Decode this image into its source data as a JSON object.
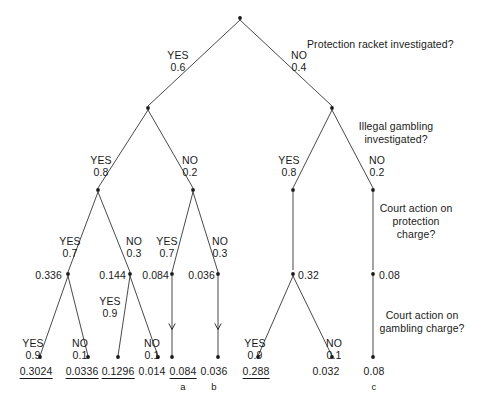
{
  "diagram": {
    "type": "probability-decision-tree",
    "title_questions": [
      {
        "id": "q1",
        "text": "Protection racket investigated?",
        "x": 307,
        "y": 38,
        "align": "left"
      },
      {
        "id": "q2",
        "text": "Illegal gambling\ninvestigated?",
        "x": 396,
        "y": 120,
        "align": "center"
      },
      {
        "id": "q3",
        "text": "Court action on\nprotection\ncharge?",
        "x": 416,
        "y": 202,
        "align": "center"
      },
      {
        "id": "q4",
        "text": "Court action on\ngambling charge?",
        "x": 422,
        "y": 309,
        "align": "center"
      }
    ],
    "branch_labels": [
      {
        "id": "b-root-yes",
        "answer": "YES",
        "prob": "0.6",
        "x": 178,
        "y": 49
      },
      {
        "id": "b-root-no",
        "answer": "NO",
        "prob": "0.4",
        "x": 299,
        "y": 49
      },
      {
        "id": "b-l-yes",
        "answer": "YES",
        "prob": "0.8",
        "x": 101,
        "y": 154
      },
      {
        "id": "b-l-no",
        "answer": "NO",
        "prob": "0.2",
        "x": 190,
        "y": 154
      },
      {
        "id": "b-r-yes",
        "answer": "YES",
        "prob": "0.8",
        "x": 289,
        "y": 154
      },
      {
        "id": "b-r-no",
        "answer": "NO",
        "prob": "0.2",
        "x": 377,
        "y": 154
      },
      {
        "id": "b-ll-yes",
        "answer": "YES",
        "prob": "0.7",
        "x": 70,
        "y": 235
      },
      {
        "id": "b-ll-no",
        "answer": "NO",
        "prob": "0.3",
        "x": 134,
        "y": 235
      },
      {
        "id": "b-lr-yes",
        "answer": "YES",
        "prob": "0.7",
        "x": 167,
        "y": 235
      },
      {
        "id": "b-lr-no",
        "answer": "NO",
        "prob": "0.3",
        "x": 220,
        "y": 235
      },
      {
        "id": "b-lll-yes",
        "answer": "YES",
        "prob": "0.9",
        "x": 33,
        "y": 337
      },
      {
        "id": "b-lll-no",
        "answer": "NO",
        "prob": "0.1",
        "x": 80,
        "y": 337
      },
      {
        "id": "b-llr-yes",
        "answer": "YES",
        "prob": "0.9",
        "x": 110,
        "y": 295
      },
      {
        "id": "b-llr-no",
        "answer": "NO",
        "prob": "0.1",
        "x": 152,
        "y": 337
      },
      {
        "id": "b-rl-yes",
        "answer": "YES",
        "prob": "0.9",
        "x": 255,
        "y": 337
      },
      {
        "id": "b-rl-no",
        "answer": "NO",
        "prob": "0.1",
        "x": 334,
        "y": 337
      }
    ],
    "node_values": [
      {
        "id": "v-0336",
        "text": "0.336",
        "x": 62,
        "y": 269,
        "align": "right"
      },
      {
        "id": "v-0144",
        "text": "0.144",
        "x": 126,
        "y": 269,
        "align": "right"
      },
      {
        "id": "v-0084m",
        "text": "0.084",
        "x": 169,
        "y": 269,
        "align": "right"
      },
      {
        "id": "v-0036m",
        "text": "0.036",
        "x": 215,
        "y": 269,
        "align": "right"
      },
      {
        "id": "v-032",
        "text": "0.32",
        "x": 298,
        "y": 269,
        "align": "left"
      },
      {
        "id": "v-008m",
        "text": "0.08",
        "x": 379,
        "y": 269,
        "align": "left"
      }
    ],
    "terminals": [
      {
        "id": "t-03024",
        "text": "0.3024",
        "x": 36,
        "y": 365,
        "underline": true,
        "tag": ""
      },
      {
        "id": "t-00336",
        "text": "0.0336",
        "x": 82,
        "y": 365,
        "underline": true,
        "tag": ""
      },
      {
        "id": "t-01296",
        "text": "0.1296",
        "x": 118,
        "y": 365,
        "underline": true,
        "tag": ""
      },
      {
        "id": "t-0014",
        "text": "0.014",
        "x": 152,
        "y": 365,
        "underline": false,
        "tag": ""
      },
      {
        "id": "t-0084",
        "text": "0.084",
        "x": 183,
        "y": 365,
        "underline": true,
        "tag": "a"
      },
      {
        "id": "t-0036",
        "text": "0.036",
        "x": 214,
        "y": 365,
        "underline": false,
        "tag": "b"
      },
      {
        "id": "t-0288",
        "text": "0.288",
        "x": 256,
        "y": 365,
        "underline": true,
        "tag": ""
      },
      {
        "id": "t-0032",
        "text": "0.032",
        "x": 326,
        "y": 365,
        "underline": false,
        "tag": ""
      },
      {
        "id": "t-008",
        "text": "0.08",
        "x": 374,
        "y": 365,
        "underline": false,
        "tag": "c"
      }
    ],
    "edges": [
      {
        "id": "e-root-l",
        "x1": 240,
        "y1": 20,
        "x2": 148,
        "y2": 106,
        "arrow": false
      },
      {
        "id": "e-root-r",
        "x1": 240,
        "y1": 20,
        "x2": 332,
        "y2": 106,
        "arrow": false
      },
      {
        "id": "e-l-ll",
        "x1": 148,
        "y1": 110,
        "x2": 98,
        "y2": 188,
        "arrow": false
      },
      {
        "id": "e-l-lr",
        "x1": 148,
        "y1": 110,
        "x2": 193,
        "y2": 188,
        "arrow": false
      },
      {
        "id": "e-r-rl",
        "x1": 332,
        "y1": 110,
        "x2": 293,
        "y2": 188,
        "arrow": false
      },
      {
        "id": "e-r-rr",
        "x1": 332,
        "y1": 110,
        "x2": 373,
        "y2": 188,
        "arrow": false
      },
      {
        "id": "e-ll-a",
        "x1": 98,
        "y1": 192,
        "x2": 68,
        "y2": 272,
        "arrow": false
      },
      {
        "id": "e-ll-b",
        "x1": 98,
        "y1": 192,
        "x2": 130,
        "y2": 272,
        "arrow": false
      },
      {
        "id": "e-lr-a",
        "x1": 193,
        "y1": 192,
        "x2": 172,
        "y2": 272,
        "arrow": false
      },
      {
        "id": "e-lr-b",
        "x1": 193,
        "y1": 192,
        "x2": 218,
        "y2": 272,
        "arrow": false
      },
      {
        "id": "e-rl-v",
        "x1": 293,
        "y1": 192,
        "x2": 293,
        "y2": 270,
        "arrow": false
      },
      {
        "id": "e-rr-v",
        "x1": 373,
        "y1": 192,
        "x2": 373,
        "y2": 270,
        "arrow": false
      },
      {
        "id": "e-0336-a",
        "x1": 68,
        "y1": 276,
        "x2": 40,
        "y2": 356,
        "arrow": false
      },
      {
        "id": "e-0336-b",
        "x1": 68,
        "y1": 276,
        "x2": 88,
        "y2": 356,
        "arrow": false
      },
      {
        "id": "e-0144-a",
        "x1": 130,
        "y1": 276,
        "x2": 118,
        "y2": 356,
        "arrow": false
      },
      {
        "id": "e-0144-b",
        "x1": 130,
        "y1": 276,
        "x2": 158,
        "y2": 356,
        "arrow": false
      },
      {
        "id": "e-0084-v",
        "x1": 172,
        "y1": 276,
        "x2": 172,
        "y2": 357,
        "arrow": true
      },
      {
        "id": "e-0036-v",
        "x1": 218,
        "y1": 276,
        "x2": 218,
        "y2": 357,
        "arrow": true
      },
      {
        "id": "e-032-a",
        "x1": 293,
        "y1": 276,
        "x2": 258,
        "y2": 356,
        "arrow": false
      },
      {
        "id": "e-032-b",
        "x1": 293,
        "y1": 276,
        "x2": 332,
        "y2": 356,
        "arrow": false
      },
      {
        "id": "e-008-v",
        "x1": 373,
        "y1": 276,
        "x2": 373,
        "y2": 356,
        "arrow": false
      }
    ],
    "nodes": [
      {
        "id": "n-root",
        "x": 240,
        "y": 18
      },
      {
        "id": "n-l",
        "x": 148,
        "y": 108
      },
      {
        "id": "n-r",
        "x": 332,
        "y": 108
      },
      {
        "id": "n-ll",
        "x": 98,
        "y": 190
      },
      {
        "id": "n-lr",
        "x": 193,
        "y": 190
      },
      {
        "id": "n-rl",
        "x": 293,
        "y": 190
      },
      {
        "id": "n-rr",
        "x": 373,
        "y": 190
      },
      {
        "id": "n-0336",
        "x": 68,
        "y": 274
      },
      {
        "id": "n-0144",
        "x": 130,
        "y": 274
      },
      {
        "id": "n-0084",
        "x": 172,
        "y": 274
      },
      {
        "id": "n-0036",
        "x": 218,
        "y": 274
      },
      {
        "id": "n-032",
        "x": 293,
        "y": 274
      },
      {
        "id": "n-008",
        "x": 373,
        "y": 274
      },
      {
        "id": "n-t1",
        "x": 40,
        "y": 357
      },
      {
        "id": "n-t2",
        "x": 88,
        "y": 357
      },
      {
        "id": "n-t3",
        "x": 118,
        "y": 357
      },
      {
        "id": "n-t4",
        "x": 158,
        "y": 357
      },
      {
        "id": "n-t5",
        "x": 172,
        "y": 357
      },
      {
        "id": "n-t6",
        "x": 218,
        "y": 357
      },
      {
        "id": "n-t7",
        "x": 258,
        "y": 357
      },
      {
        "id": "n-t8",
        "x": 332,
        "y": 357
      },
      {
        "id": "n-t9",
        "x": 373,
        "y": 357
      }
    ],
    "colors": {
      "stroke": "#1a1a1a",
      "text": "#1a1a1a",
      "background": "#ffffff"
    }
  }
}
